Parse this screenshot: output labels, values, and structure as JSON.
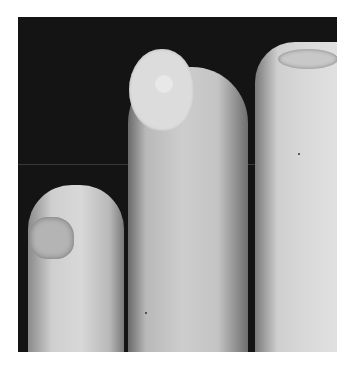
{
  "image": {
    "description": "Grayscale clinical photograph of three fingertips against a dark background",
    "subjects": [
      {
        "name": "left-finger",
        "feature": "damaged/dystrophic nail"
      },
      {
        "name": "middle-finger",
        "feature": "round white disc on nail"
      },
      {
        "name": "right-finger",
        "feature": "nail at top edge"
      }
    ],
    "background_color": "#141414",
    "border_color": "#ffffff"
  }
}
